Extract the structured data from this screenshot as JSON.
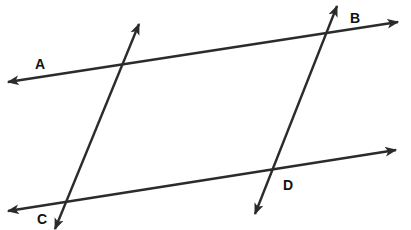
{
  "diagram": {
    "type": "geometry-lines",
    "stroke_color": "#2b2b2b",
    "lines": [
      {
        "id": "top-line",
        "x1": 8,
        "y1": 82,
        "x2": 398,
        "y2": 22
      },
      {
        "id": "bottom-line",
        "x1": 8,
        "y1": 211,
        "x2": 396,
        "y2": 150
      },
      {
        "id": "left-transversal",
        "x1": 55,
        "y1": 229,
        "x2": 139,
        "y2": 24
      },
      {
        "id": "right-transversal",
        "x1": 255,
        "y1": 214,
        "x2": 337,
        "y2": 6
      }
    ],
    "labels": [
      {
        "id": "A",
        "text": "A",
        "x": 40,
        "y": 64
      },
      {
        "id": "B",
        "text": "B",
        "x": 355,
        "y": 18
      },
      {
        "id": "C",
        "text": "C",
        "x": 42,
        "y": 219
      },
      {
        "id": "D",
        "text": "D",
        "x": 288,
        "y": 185
      }
    ]
  }
}
